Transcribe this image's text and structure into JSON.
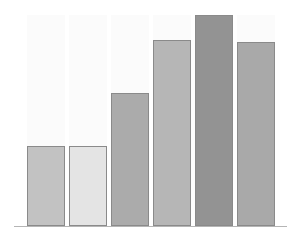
{
  "chart_data": {
    "type": "bar",
    "title": "",
    "xlabel": "",
    "ylabel": "",
    "categories": [
      "1",
      "2",
      "3",
      "4",
      "5",
      "6"
    ],
    "values": [
      38,
      38,
      63,
      88,
      100,
      87
    ],
    "ylim": [
      0,
      100
    ],
    "grid": false,
    "legend": null,
    "bar_colors": [
      "#c2c2c2",
      "#e4e4e4",
      "#ababab",
      "#b6b6b6",
      "#939393",
      "#a9a9a9"
    ],
    "border_color": "#8a8a8a",
    "background_column_color": "#fbfbfb"
  }
}
